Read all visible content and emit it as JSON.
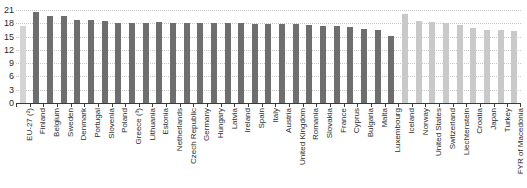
{
  "chart_data": {
    "type": "bar",
    "title": "",
    "subtitle": "",
    "xlabel": "",
    "ylabel": "",
    "ylim": [
      0,
      21
    ],
    "yticks": [
      0,
      3,
      6,
      9,
      12,
      15,
      18,
      21
    ],
    "grid": true,
    "legend_position": "none",
    "categories": [
      "EU-27 (²)",
      "Finland",
      "Belgium",
      "Sweden",
      "Denmark",
      "Portugal",
      "Slovenia",
      "Poland",
      "Greece (³)",
      "Lithuania",
      "Estonia",
      "Netherlands",
      "Czech Republic",
      "Germany",
      "Hungary",
      "Latvia",
      "Ireland",
      "Spain",
      "Italy",
      "Austria",
      "United Kingdom",
      "Romania",
      "Slovakia",
      "France",
      "Cyprus",
      "Bulgaria",
      "Malta",
      "Luxembourg",
      "Iceland",
      "Norway",
      "United States",
      "Switzerland",
      "Liechtenstein",
      "Croatia",
      "Japan",
      "Turkey",
      "FYR of Macedonia"
    ],
    "values": [
      17.3,
      20.5,
      19.6,
      19.7,
      18.7,
      18.7,
      18.5,
      18.1,
      18.1,
      18.1,
      18.2,
      18.0,
      18.0,
      18.0,
      18.0,
      18.0,
      18.0,
      17.9,
      17.9,
      17.8,
      17.8,
      17.6,
      17.5,
      17.3,
      17.2,
      16.8,
      16.6,
      15.2,
      20.0,
      18.6,
      18.2,
      18.0,
      17.7,
      17.0,
      16.6,
      16.5,
      16.2
    ],
    "series": [
      {
        "name": "EU aggregate",
        "color": "#d4d4d4"
      },
      {
        "name": "EU Member States",
        "color": "#6e6e6e"
      },
      {
        "name": "Non-EU countries",
        "color": "#c9c9c9"
      }
    ],
    "bar_kinds": [
      "eu-aggregate",
      "member",
      "member",
      "member",
      "member",
      "member",
      "member",
      "member",
      "member",
      "member",
      "member",
      "member",
      "member",
      "member",
      "member",
      "member",
      "member",
      "member",
      "member",
      "member",
      "member",
      "member",
      "member",
      "member",
      "member",
      "member",
      "member",
      "member",
      "non-member",
      "non-member",
      "non-member",
      "non-member",
      "non-member",
      "non-member",
      "non-member",
      "non-member",
      "non-member"
    ]
  },
  "colors": {
    "eu_aggregate": "#d4d4d4",
    "member": "#6e6e6e",
    "non_member": "#c9c9c9",
    "axis": "#3a3a3a",
    "grid": "#c8c8c8",
    "text": "#2b2b2b",
    "background": "#ffffff"
  }
}
